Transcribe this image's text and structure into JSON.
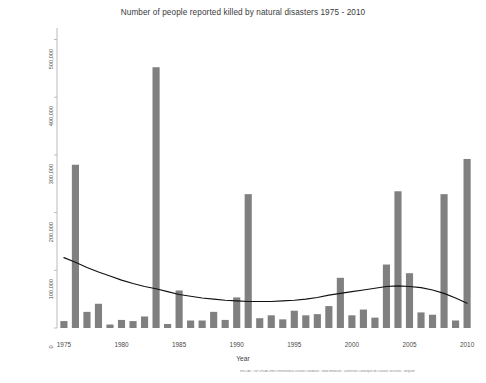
{
  "chart_data": {
    "type": "bar",
    "title": "Number of people reported killed by natural disasters 1975 - 2010",
    "xlabel": "Year",
    "ylabel": "Number of people reported killed",
    "xlim": [
      1974.4,
      2010.6
    ],
    "ylim": [
      0,
      520000
    ],
    "grid": false,
    "legend": null,
    "y_ticks": [
      0,
      100000,
      200000,
      300000,
      400000,
      500000
    ],
    "y_tick_labels": [
      "0",
      "100,000",
      "200,000",
      "300,000",
      "400,000",
      "500,000"
    ],
    "x_ticks": [
      1975,
      1980,
      1985,
      1990,
      1995,
      2000,
      2005,
      2010
    ],
    "x_tick_labels": [
      "1975",
      "1980",
      "1985",
      "1990",
      "1995",
      "2000",
      "2005",
      "2010"
    ],
    "bar_color": "#808080",
    "trend_color": "#111111",
    "axis_color": "#b3b3b3",
    "categories": [
      1975,
      1976,
      1977,
      1978,
      1979,
      1980,
      1981,
      1982,
      1983,
      1984,
      1985,
      1986,
      1987,
      1988,
      1989,
      1990,
      1991,
      1992,
      1993,
      1994,
      1995,
      1996,
      1997,
      1998,
      1999,
      2000,
      2001,
      2002,
      2003,
      2004,
      2005,
      2006,
      2007,
      2008,
      2009,
      2010
    ],
    "series": [
      {
        "name": "People reported killed",
        "values": [
          12000,
          283000,
          28000,
          42000,
          6000,
          14000,
          12000,
          20000,
          452000,
          7000,
          65000,
          13000,
          13000,
          28000,
          14000,
          53000,
          232000,
          17000,
          22000,
          15000,
          30000,
          22000,
          24000,
          38000,
          87000,
          22000,
          32000,
          18000,
          110000,
          237000,
          95000,
          27000,
          23000,
          232000,
          13000,
          293000
        ]
      },
      {
        "name": "Trend",
        "type": "line",
        "values": [
          122000,
          114000,
          105000,
          97000,
          90000,
          83000,
          77000,
          72000,
          68000,
          63000,
          58000,
          55000,
          52000,
          50000,
          48000,
          47000,
          46000,
          46000,
          46000,
          47000,
          48000,
          50000,
          53000,
          57000,
          60000,
          63000,
          66000,
          69000,
          72000,
          73000,
          72000,
          70000,
          66000,
          60000,
          52000,
          43000
        ]
      }
    ],
    "source_note": "EM-DAT: The OFDA/CRED International Disaster Database - www.emdat.be - Universite Catholique de Louvain, Brussels - Belgium"
  }
}
